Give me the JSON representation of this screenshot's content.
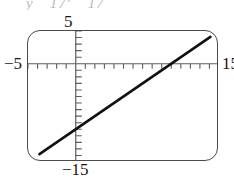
{
  "clipped_text": {
    "fragment_1": "y",
    "fragment_2": "17",
    "fragment_2_sup": "x",
    "fragment_3": "17"
  },
  "window_labels": {
    "ymax": "5",
    "xmin": "−5",
    "xmax": "15",
    "ymin": "−15"
  },
  "colors": {
    "curve": "#111111",
    "axis": "#5c5c5c",
    "bezel": "#4a4a4a",
    "background": "#ffffff",
    "clipped_text": "#b9b9b9"
  },
  "chart_data": {
    "type": "line",
    "title": "",
    "xlabel": "",
    "ylabel": "",
    "xlim": [
      -5,
      15
    ],
    "ylim": [
      -15,
      5
    ],
    "xtick_step": 1,
    "ytick_step": 1,
    "grid": false,
    "legend": false,
    "axis_labels": {
      "xmin": "−5",
      "xmax": "15",
      "ymin": "−15",
      "ymax": "5"
    },
    "series": [
      {
        "name": "line",
        "kind": "line",
        "slope": 1,
        "intercept": -10,
        "x": [
          -3.8,
          14.1
        ],
        "y": [
          -13.8,
          4.1
        ],
        "x_intercept": 10,
        "y_intercept": -10,
        "linewidth": 2.6,
        "color": "#111111"
      }
    ]
  }
}
